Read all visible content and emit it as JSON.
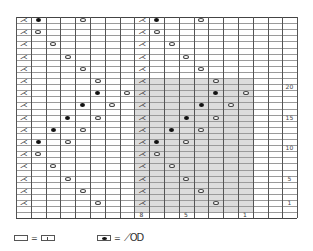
{
  "chart_meta": {
    "type": "knitting-chart",
    "columns": 19,
    "rows": 33,
    "cell_width_px": 14.8,
    "cell_height_px": 6.1,
    "shaded_region": {
      "col_start": 8,
      "col_end": 15,
      "row_start": 1,
      "row_end": 21
    },
    "colors": {
      "grid": "#555555",
      "shade": "#dcdcdc",
      "symbol": "#111111"
    }
  },
  "row_numbers": [
    {
      "label": "20",
      "row": 20
    },
    {
      "label": "15",
      "row": 15
    },
    {
      "label": "10",
      "row": 10
    },
    {
      "label": "5",
      "row": 5
    },
    {
      "label": "1",
      "row": 1
    }
  ],
  "column_numbers": [
    {
      "label": "8",
      "col": 8
    },
    {
      "label": "5",
      "col": 11
    },
    {
      "label": "1",
      "col": 15
    }
  ],
  "symbol_glyphs": {
    "decrease": "⋌",
    "yarn_over": "○",
    "bobble": "●"
  },
  "symbols": [
    {
      "row": 31,
      "cells": [
        [
          0,
          "decrease"
        ],
        [
          1,
          "bobble"
        ],
        [
          4,
          "yarn_over"
        ],
        [
          8,
          "decrease"
        ],
        [
          9,
          "bobble"
        ],
        [
          12,
          "yarn_over"
        ]
      ]
    },
    {
      "row": 29,
      "cells": [
        [
          0,
          "decrease"
        ],
        [
          1,
          "yarn_over"
        ],
        [
          8,
          "decrease"
        ],
        [
          9,
          "yarn_over"
        ]
      ]
    },
    {
      "row": 27,
      "cells": [
        [
          0,
          "decrease"
        ],
        [
          2,
          "yarn_over"
        ],
        [
          8,
          "decrease"
        ],
        [
          10,
          "yarn_over"
        ]
      ]
    },
    {
      "row": 25,
      "cells": [
        [
          0,
          "decrease"
        ],
        [
          3,
          "yarn_over"
        ],
        [
          8,
          "decrease"
        ],
        [
          11,
          "yarn_over"
        ]
      ]
    },
    {
      "row": 23,
      "cells": [
        [
          0,
          "decrease"
        ],
        [
          4,
          "yarn_over"
        ],
        [
          8,
          "decrease"
        ],
        [
          12,
          "yarn_over"
        ]
      ]
    },
    {
      "row": 21,
      "cells": [
        [
          0,
          "decrease"
        ],
        [
          5,
          "yarn_over"
        ],
        [
          8,
          "decrease"
        ],
        [
          13,
          "yarn_over"
        ]
      ]
    },
    {
      "row": 19,
      "cells": [
        [
          0,
          "decrease"
        ],
        [
          5,
          "bobble"
        ],
        [
          7,
          "yarn_over"
        ],
        [
          8,
          "decrease"
        ],
        [
          13,
          "bobble"
        ],
        [
          15,
          "yarn_over"
        ]
      ]
    },
    {
      "row": 17,
      "cells": [
        [
          0,
          "decrease"
        ],
        [
          4,
          "bobble"
        ],
        [
          6,
          "yarn_over"
        ],
        [
          8,
          "decrease"
        ],
        [
          12,
          "bobble"
        ],
        [
          14,
          "yarn_over"
        ]
      ]
    },
    {
      "row": 15,
      "cells": [
        [
          0,
          "decrease"
        ],
        [
          3,
          "bobble"
        ],
        [
          5,
          "yarn_over"
        ],
        [
          8,
          "decrease"
        ],
        [
          11,
          "bobble"
        ],
        [
          13,
          "yarn_over"
        ]
      ]
    },
    {
      "row": 13,
      "cells": [
        [
          0,
          "decrease"
        ],
        [
          2,
          "bobble"
        ],
        [
          4,
          "yarn_over"
        ],
        [
          8,
          "decrease"
        ],
        [
          10,
          "bobble"
        ],
        [
          12,
          "yarn_over"
        ]
      ]
    },
    {
      "row": 11,
      "cells": [
        [
          0,
          "decrease"
        ],
        [
          1,
          "bobble"
        ],
        [
          3,
          "yarn_over"
        ],
        [
          8,
          "decrease"
        ],
        [
          9,
          "bobble"
        ],
        [
          11,
          "yarn_over"
        ]
      ]
    },
    {
      "row": 9,
      "cells": [
        [
          0,
          "decrease"
        ],
        [
          1,
          "yarn_over"
        ],
        [
          8,
          "decrease"
        ],
        [
          9,
          "yarn_over"
        ]
      ]
    },
    {
      "row": 7,
      "cells": [
        [
          0,
          "decrease"
        ],
        [
          2,
          "yarn_over"
        ],
        [
          8,
          "decrease"
        ],
        [
          10,
          "yarn_over"
        ]
      ]
    },
    {
      "row": 5,
      "cells": [
        [
          0,
          "decrease"
        ],
        [
          3,
          "yarn_over"
        ],
        [
          8,
          "decrease"
        ],
        [
          11,
          "yarn_over"
        ]
      ]
    },
    {
      "row": 3,
      "cells": [
        [
          0,
          "decrease"
        ],
        [
          4,
          "yarn_over"
        ],
        [
          8,
          "decrease"
        ],
        [
          12,
          "yarn_over"
        ]
      ]
    },
    {
      "row": 1,
      "cells": [
        [
          0,
          "decrease"
        ],
        [
          5,
          "yarn_over"
        ],
        [
          8,
          "decrease"
        ],
        [
          13,
          "yarn_over"
        ]
      ]
    }
  ],
  "legend": {
    "knit": {
      "equals": "=",
      "meaning_symbol": "|"
    },
    "bobble": {
      "equals": "=",
      "meaning_symbol": "⟋OD"
    }
  }
}
